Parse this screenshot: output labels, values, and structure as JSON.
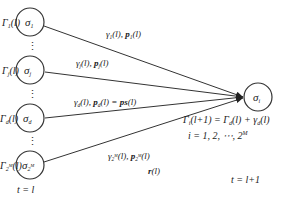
{
  "source_nodes": [
    {
      "id": "sigma-1",
      "label": "σ",
      "sub": "1",
      "gamma_label": "Γ",
      "gamma_sub": "1",
      "gamma_arg": "(l)",
      "edge_label": "γ₁(l), p₁(l)"
    },
    {
      "id": "sigma-j",
      "label": "σ",
      "sub": "j",
      "gamma_label": "Γ",
      "gamma_sub": "j",
      "gamma_arg": "(l)",
      "edge_label": "γⱼ(l), pⱼ(l)"
    },
    {
      "id": "sigma-d",
      "label": "σ",
      "sub": "d",
      "gamma_label": "Γ",
      "gamma_sub": "d",
      "gamma_arg": "(l)",
      "edge_label": "γd(l), pd(l) = ps(l)"
    },
    {
      "id": "sigma-2M",
      "label": "σ",
      "sub": "2ᴹ",
      "gamma_label": "Γ",
      "gamma_sub": "2ᴹ",
      "gamma_arg": "(l)",
      "edge_label": "γ2ᴹ(l), p2ᴹ(l)",
      "edge_label2": "r(l)"
    }
  ],
  "target_node": {
    "label": "σ",
    "sub": "i"
  },
  "ellipsis": "⋮",
  "time_left": "t = l",
  "time_right": "t = l+1",
  "equation_update": "Γi(l+1) = Γd(l) + γd(l)",
  "equation_range": "i = 1, 2, ⋯, 2ᴹ"
}
